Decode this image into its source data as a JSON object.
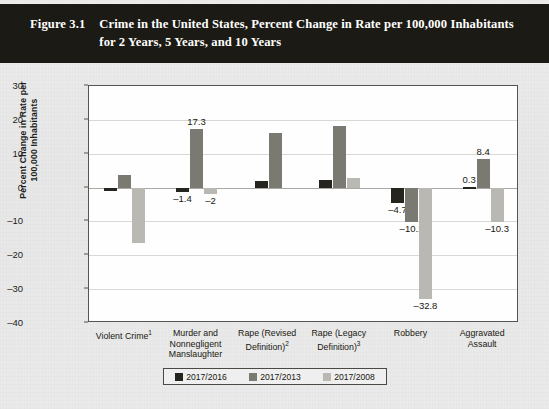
{
  "header": {
    "figure_number": "Figure 3.1",
    "title": "Crime in the United States, Percent Change in Rate per 100,000 Inhabitants for 2 Years, 5 Years, and 10 Years"
  },
  "colors": {
    "series_2017_2016": "#25241f",
    "series_2017_2013": "#7b7a72",
    "series_2017_2008": "#b9b8b2",
    "header_band": "#1b1a14",
    "page_background": "#e9e9e9",
    "plot_background": "#fefefe"
  },
  "legend": {
    "items": [
      {
        "label": "2017/2016",
        "color": "#25241f"
      },
      {
        "label": "2017/2013",
        "color": "#7b7a72"
      },
      {
        "label": "2017/2008",
        "color": "#b9b8b2"
      }
    ]
  },
  "chart_data": {
    "type": "bar",
    "title": "Crime in the United States, Percent Change in Rate per 100,000 Inhabitants for 2 Years, 5 Years, and 10 Years",
    "xlabel": "",
    "ylabel": "Percent Change in Rate per 100,000 Inhabitants",
    "ylim": [
      -40,
      30
    ],
    "yticks": [
      30,
      20,
      10,
      0,
      -10,
      -20,
      -30,
      -40
    ],
    "ytick_labels": [
      "30",
      "20",
      "10",
      "0",
      "–10",
      "–20",
      "–30",
      "–40"
    ],
    "grid": true,
    "legend_position": "bottom",
    "categories": [
      "Violent Crime¹",
      "Murder and Nonnegligent Manslaughter",
      "Rape (Revised Definition)²",
      "Rape (Legacy Definition)³",
      "Robbery",
      "Aggravated Assault"
    ],
    "category_lines": [
      [
        "Violent Crime",
        "1"
      ],
      [
        "Murder and\nNonnegligent\nManslaughter",
        ""
      ],
      [
        "Rape (Revised\nDefinition)",
        "2"
      ],
      [
        "Rape (Legacy\nDefinition)",
        "3"
      ],
      [
        "Robbery",
        ""
      ],
      [
        "Aggravated\nAssault",
        ""
      ]
    ],
    "series": [
      {
        "name": "2017/2016",
        "values": [
          -0.9,
          -1.4,
          1.8,
          2.2,
          -4.7,
          0.3
        ]
      },
      {
        "name": "2017/2013",
        "values": [
          3.7,
          17.3,
          16,
          18.2,
          -10.1,
          8.4
        ]
      },
      {
        "name": "2017/2008",
        "values": [
          -16.5,
          -2,
          null,
          2.7,
          -32.8,
          -10.3
        ]
      }
    ],
    "data_labels": [
      {
        "category": "Violent Crime",
        "series": "2017/2016",
        "text": "–0.9"
      },
      {
        "category": "Violent Crime",
        "series": "2017/2013",
        "text": "3.7"
      },
      {
        "category": "Violent Crime",
        "series": "2017/2008",
        "text": "–16.5"
      },
      {
        "category": "Murder and Nonnegligent Manslaughter",
        "series": "2017/2016",
        "text": "–1.4"
      },
      {
        "category": "Murder and Nonnegligent Manslaughter",
        "series": "2017/2013",
        "text": "17.3"
      },
      {
        "category": "Murder and Nonnegligent Manslaughter",
        "series": "2017/2008",
        "text": "–2"
      },
      {
        "category": "Rape (Revised Definition)",
        "series": "2017/2016",
        "text": "1.8"
      },
      {
        "category": "Rape (Revised Definition)",
        "series": "2017/2013",
        "text": "16"
      },
      {
        "category": "Rape (Legacy Definition)",
        "series": "2017/2016",
        "text": "2.2"
      },
      {
        "category": "Rape (Legacy Definition)",
        "series": "2017/2013",
        "text": "18.2"
      },
      {
        "category": "Rape (Legacy Definition)",
        "series": "2017/2008",
        "text": "2.7"
      },
      {
        "category": "Robbery",
        "series": "2017/2016",
        "text": "–4.7"
      },
      {
        "category": "Robbery",
        "series": "2017/2013",
        "text": "–10.1"
      },
      {
        "category": "Robbery",
        "series": "2017/2008",
        "text": "–32.8"
      },
      {
        "category": "Aggravated Assault",
        "series": "2017/2016",
        "text": "0.3"
      },
      {
        "category": "Aggravated Assault",
        "series": "2017/2013",
        "text": "8.4"
      },
      {
        "category": "Aggravated Assault",
        "series": "2017/2008",
        "text": "–10.3"
      }
    ]
  }
}
